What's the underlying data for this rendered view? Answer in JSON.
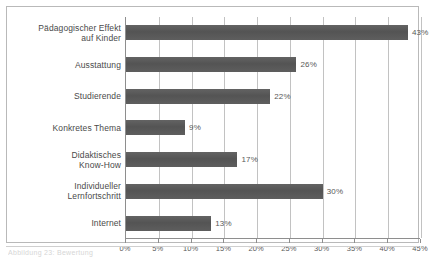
{
  "chart_data": {
    "type": "bar",
    "orientation": "horizontal",
    "title": "",
    "xlabel": "",
    "ylabel": "",
    "categories": [
      "Pädagogischer Effekt auf Kinder",
      "Ausstattung",
      "Studierende",
      "Konkretes Thema",
      "Didaktisches Know-How",
      "Individueller Lernfortschritt",
      "Internet"
    ],
    "category_lines": [
      [
        "Pädagogischer Effekt",
        "auf Kinder"
      ],
      [
        "Ausstattung"
      ],
      [
        "Studierende"
      ],
      [
        "Konkretes Thema"
      ],
      [
        "Didaktisches",
        "Know-How"
      ],
      [
        "Individueller",
        "Lernfortschritt"
      ],
      [
        "Internet"
      ]
    ],
    "values": [
      43,
      26,
      22,
      9,
      17,
      30,
      13
    ],
    "value_labels": [
      "43%",
      "26%",
      "22%",
      "9%",
      "17%",
      "30%",
      "13%"
    ],
    "xlim": [
      0,
      45
    ],
    "xticks": [
      0,
      5,
      10,
      15,
      20,
      25,
      30,
      35,
      40,
      45
    ],
    "xtick_labels": [
      "0%",
      "5%",
      "10%",
      "15%",
      "20%",
      "25%",
      "30%",
      "35%",
      "40%",
      "45%"
    ],
    "grid": "vertical",
    "legend": null,
    "bar_color": "#5c5c5c",
    "grid_color": "#c2c2c2",
    "axis_color": "#8e8e8e"
  },
  "caption": {
    "text": "Abbildung 23: Bewertung"
  }
}
